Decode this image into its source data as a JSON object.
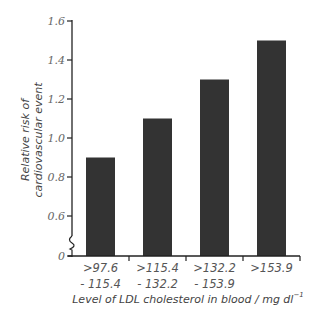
{
  "chart_data": {
    "type": "bar",
    "title": "",
    "categories": [
      ">97.6 - 115.4",
      ">115.4 - 132.2",
      ">132.2 - 153.9",
      ">153.9"
    ],
    "category_lines": [
      [
        ">97.6",
        "- 115.4"
      ],
      [
        ">115.4",
        "- 132.2"
      ],
      [
        ">132.2",
        "- 153.9"
      ],
      [
        ">153.9"
      ]
    ],
    "values": [
      0.9,
      1.1,
      1.3,
      1.5
    ],
    "xlabel": "Level of LDL cholesterol in blood / mg dl",
    "xlabel_superscript": "−1",
    "ylabel_lines": [
      "Relative risk of",
      "cardiovascular event"
    ],
    "yticks": [
      "0",
      "0.6",
      "0.8",
      "1.0",
      "1.2",
      "1.4",
      "1.6"
    ],
    "ylim": [
      0,
      1.6
    ],
    "axis_break": true,
    "grid": false,
    "bar_color": "#333333"
  }
}
